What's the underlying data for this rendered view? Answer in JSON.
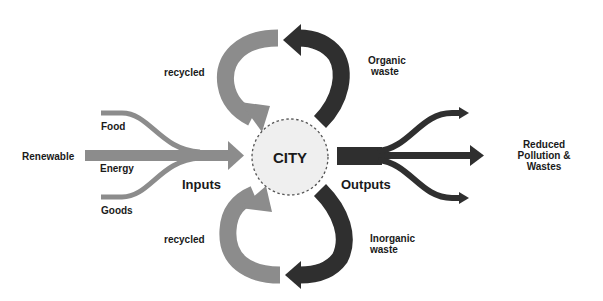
{
  "diagram": {
    "center": {
      "label": "CITY"
    },
    "inputs": {
      "heading": "Inputs",
      "source": "Renewable",
      "items": [
        "Food",
        "Energy",
        "Goods"
      ]
    },
    "outputs": {
      "heading": "Outputs",
      "destination_lines": [
        "Reduced",
        "Pollution &",
        "Wastes"
      ]
    },
    "loops": {
      "top": {
        "recycled_label": "recycled",
        "waste_lines": [
          "Organic",
          "waste"
        ]
      },
      "bottom": {
        "recycled_label": "recycled",
        "waste_lines": [
          "Inorganic",
          "waste"
        ]
      }
    },
    "colors": {
      "input_gray": "#8c8c8c",
      "output_dark": "#2f2f2f",
      "city_fill": "#efefef",
      "city_border": "#555555"
    }
  }
}
